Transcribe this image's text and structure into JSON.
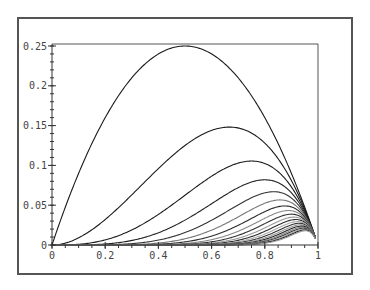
{
  "chart_data": {
    "type": "line",
    "title": "",
    "xlabel": "",
    "ylabel": "",
    "xlim": [
      0,
      1
    ],
    "ylim": [
      0,
      0.25
    ],
    "grid": false,
    "legend": null,
    "x_ticks": [
      "0",
      "0.2",
      "0.4",
      "0.6",
      "0.8",
      "1"
    ],
    "x_tick_values": [
      0,
      0.2,
      0.4,
      0.6,
      0.8,
      1
    ],
    "y_ticks": [
      "0",
      "0.05",
      "0.1",
      "0.15",
      "0.2",
      "0.25"
    ],
    "y_tick_values": [
      0,
      0.05,
      0.1,
      0.15,
      0.2,
      0.25
    ],
    "x_minor_step": 0.05,
    "y_minor_step": 0.01,
    "series_formula": "x^n*(1-x)",
    "n_values": [
      1,
      2,
      3,
      4,
      5,
      6,
      7,
      8,
      9,
      10,
      11,
      12,
      13,
      14,
      15,
      16,
      17,
      18,
      19,
      20
    ],
    "x_sample_max": 0.99,
    "series": [
      {
        "name": "n=1",
        "peak_x": 0.5,
        "peak_y": 0.25
      },
      {
        "name": "n=2",
        "peak_x": 0.667,
        "peak_y": 0.148
      },
      {
        "name": "n=3",
        "peak_x": 0.75,
        "peak_y": 0.105
      },
      {
        "name": "n=4",
        "peak_x": 0.8,
        "peak_y": 0.082
      },
      {
        "name": "n=5",
        "peak_x": 0.833,
        "peak_y": 0.067
      },
      {
        "name": "n=6",
        "peak_x": 0.857,
        "peak_y": 0.057
      },
      {
        "name": "n=7",
        "peak_x": 0.875,
        "peak_y": 0.049
      },
      {
        "name": "n=8",
        "peak_x": 0.889,
        "peak_y": 0.043
      },
      {
        "name": "n=9",
        "peak_x": 0.9,
        "peak_y": 0.039
      },
      {
        "name": "n=10",
        "peak_x": 0.909,
        "peak_y": 0.035
      }
    ],
    "line_colors": [
      "#1a1a1a",
      "#1a1a1a",
      "#1a1a1a",
      "#222222",
      "#333333",
      "#777777",
      "#2a2a2a",
      "#888888",
      "#333333",
      "#999999",
      "#2a2a2a",
      "#aaaaaa",
      "#333333",
      "#999999",
      "#222222",
      "#888888",
      "#333333",
      "#aaaaaa",
      "#222222",
      "#999999"
    ]
  },
  "layout": {
    "frame_color": "#555555",
    "axis_color": "#333333"
  }
}
